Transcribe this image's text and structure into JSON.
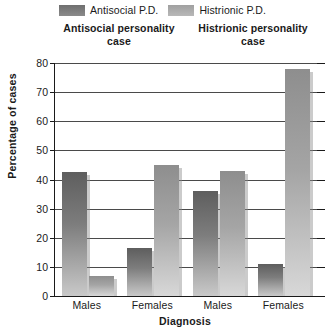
{
  "chart_data": {
    "type": "bar",
    "title": "",
    "xlabel": "Diagnosis",
    "ylabel": "Percentage of cases",
    "ylim": [
      0,
      80
    ],
    "yticks": [
      0,
      10,
      20,
      30,
      40,
      50,
      60,
      70,
      80
    ],
    "grid": true,
    "legend_position": "top",
    "categories": [
      "Males",
      "Females",
      "Males",
      "Females"
    ],
    "group_titles": [
      {
        "line1": "Antisocial personality",
        "line2": "case"
      },
      {
        "line1": "Histrionic personality",
        "line2": "case"
      }
    ],
    "series": [
      {
        "name": "Antisocial P.D.",
        "color": "#6f6f6f",
        "values": [
          42.5,
          16.5,
          36,
          11
        ]
      },
      {
        "name": "Histrionic P.D.",
        "color": "#a8a8a8",
        "values": [
          7,
          45,
          43,
          78
        ]
      }
    ],
    "bars": [
      {
        "group": 0,
        "category": "Males",
        "series": "Antisocial P.D.",
        "value": 42.5
      },
      {
        "group": 0,
        "category": "Males",
        "series": "Histrionic P.D.",
        "value": 7
      },
      {
        "group": 0,
        "category": "Females",
        "series": "Antisocial P.D.",
        "value": 16.5
      },
      {
        "group": 0,
        "category": "Females",
        "series": "Histrionic P.D.",
        "value": 45
      },
      {
        "group": 1,
        "category": "Males",
        "series": "Antisocial P.D.",
        "value": 36
      },
      {
        "group": 1,
        "category": "Males",
        "series": "Histrionic P.D.",
        "value": 43
      },
      {
        "group": 1,
        "category": "Females",
        "series": "Antisocial P.D.",
        "value": 11
      },
      {
        "group": 1,
        "category": "Females",
        "series": "Histrionic P.D.",
        "value": 78
      }
    ]
  }
}
